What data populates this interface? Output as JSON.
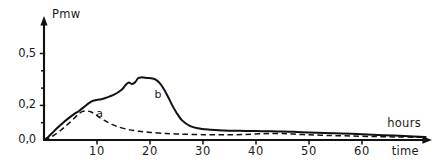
{
  "chart_data": {
    "type": "line",
    "title": "",
    "subtitle": "",
    "ylabel": "Pmw",
    "xlabel": "time",
    "xlabel_secondary": "hours",
    "xlim": [
      0,
      72
    ],
    "ylim": [
      0.0,
      0.56
    ],
    "grid": false,
    "legend_position": "inline-annotations",
    "yticks": [
      0.0,
      0.2,
      0.5
    ],
    "ytick_labels": [
      "0,0",
      "0,2",
      "0,5"
    ],
    "yticks_minor": [
      0.1,
      0.3,
      0.4
    ],
    "xticks": [
      10,
      20,
      30,
      40,
      50,
      60
    ],
    "xtick_labels": [
      "10",
      "20",
      "30",
      "40",
      "50",
      "60"
    ],
    "annotations": [
      {
        "text": "a",
        "x": 10.5,
        "y": 0.145,
        "series": "a"
      },
      {
        "text": "b",
        "x": 21.5,
        "y": 0.255,
        "series": "b"
      }
    ],
    "series": [
      {
        "name": "a",
        "label": "a",
        "style": "dashed",
        "color": "#111111",
        "x": [
          0,
          1,
          2,
          3,
          4,
          5,
          6,
          6.6,
          7.2,
          8,
          8.8,
          9.6,
          10.4,
          11.4,
          12.5,
          14,
          16,
          18,
          20,
          23,
          26,
          30,
          34,
          38,
          41,
          43,
          45,
          47,
          50,
          54,
          58,
          62,
          66,
          70,
          72
        ],
        "y": [
          0.0,
          0.012,
          0.03,
          0.052,
          0.078,
          0.105,
          0.135,
          0.152,
          0.164,
          0.168,
          0.163,
          0.15,
          0.132,
          0.113,
          0.095,
          0.076,
          0.06,
          0.05,
          0.044,
          0.038,
          0.034,
          0.031,
          0.03,
          0.032,
          0.036,
          0.038,
          0.037,
          0.034,
          0.03,
          0.026,
          0.023,
          0.02,
          0.018,
          0.016,
          0.015
        ]
      },
      {
        "name": "b",
        "label": "b",
        "style": "solid",
        "color": "#111111",
        "x": [
          0,
          0.8,
          1.6,
          2.6,
          3.6,
          4.6,
          5.6,
          6.6,
          7.6,
          8.4,
          9.2,
          10,
          10.8,
          11.6,
          12.4,
          13.2,
          14,
          14.8,
          15.4,
          16,
          16.6,
          17.2,
          17.8,
          18.4,
          19,
          19.6,
          20.2,
          21,
          21.8,
          22.6,
          23.4,
          24.2,
          25,
          26,
          27.5,
          29,
          31,
          33,
          35,
          37,
          39,
          41,
          43,
          45,
          47,
          50,
          53,
          56,
          60,
          64,
          68,
          72
        ],
        "y": [
          0.0,
          0.018,
          0.042,
          0.072,
          0.1,
          0.125,
          0.148,
          0.168,
          0.192,
          0.212,
          0.226,
          0.232,
          0.236,
          0.243,
          0.252,
          0.262,
          0.276,
          0.295,
          0.318,
          0.332,
          0.324,
          0.334,
          0.358,
          0.362,
          0.36,
          0.358,
          0.357,
          0.35,
          0.33,
          0.295,
          0.25,
          0.2,
          0.158,
          0.115,
          0.082,
          0.068,
          0.06,
          0.056,
          0.054,
          0.053,
          0.052,
          0.051,
          0.05,
          0.049,
          0.047,
          0.044,
          0.041,
          0.038,
          0.033,
          0.028,
          0.023,
          0.018
        ]
      }
    ]
  },
  "axes": {
    "y_axis_title": "Pmw",
    "x_axis_title": "time",
    "x_axis_units": "hours"
  },
  "colors": {
    "ink": "#111111",
    "background": "#ffffff"
  }
}
